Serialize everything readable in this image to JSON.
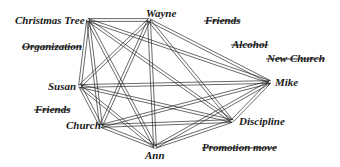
{
  "diagram": {
    "type": "network",
    "connected_nodes": [
      {
        "id": "christmas_tree",
        "label": "Christmas Tree"
      },
      {
        "id": "wayne",
        "label": "Wayne"
      },
      {
        "id": "susan",
        "label": "Susan"
      },
      {
        "id": "church",
        "label": "Church"
      },
      {
        "id": "ann",
        "label": "Ann"
      },
      {
        "id": "discipline",
        "label": "Discipline"
      },
      {
        "id": "mike",
        "label": "Mike"
      }
    ],
    "removed_nodes": [
      {
        "id": "organization",
        "label": "Organization"
      },
      {
        "id": "friends_top",
        "label": "Friends"
      },
      {
        "id": "alcohol",
        "label": "Alcohol"
      },
      {
        "id": "new_church",
        "label": "New Church"
      },
      {
        "id": "friends_left",
        "label": "Friends"
      },
      {
        "id": "promotion_move",
        "label": "Promotion move"
      }
    ],
    "edges": "all pairs of connected_nodes (double lines)"
  }
}
